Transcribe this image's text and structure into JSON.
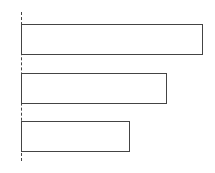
{
  "chart_data": {
    "type": "bar",
    "orientation": "horizontal",
    "title": "",
    "xlabel": "",
    "ylabel": "",
    "categories": [
      "",
      "",
      ""
    ],
    "values": [
      5,
      4,
      3
    ],
    "xlim": [
      0,
      5
    ],
    "grid": false,
    "legend": null,
    "style": {
      "bar_fill": "#ffffff",
      "bar_stroke": "#444444",
      "baseline": "dashed"
    }
  },
  "colors": {
    "stroke": "#444444",
    "fill": "#ffffff",
    "background": "#ffffff"
  }
}
